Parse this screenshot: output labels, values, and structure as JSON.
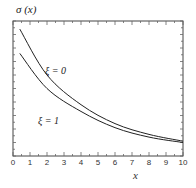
{
  "chart_data": {
    "type": "line",
    "title": "",
    "ylabel": "σ (x)",
    "xlabel": "x",
    "xlim": [
      0,
      10
    ],
    "ylim": [
      0,
      1
    ],
    "x_ticks": [
      "0",
      "1",
      "2",
      "3",
      "4",
      "5",
      "6",
      "7",
      "8",
      "9",
      "10"
    ],
    "y_ticks_labeled": false,
    "grid": false,
    "x": [
      0.4,
      2,
      4,
      6,
      8,
      10
    ],
    "series": [
      {
        "name": "ξ = 0",
        "values": [
          0.94,
          0.6,
          0.38,
          0.24,
          0.16,
          0.11
        ]
      },
      {
        "name": "ξ = 1",
        "values": [
          0.76,
          0.5,
          0.33,
          0.21,
          0.14,
          0.1
        ]
      }
    ],
    "annotations": [
      {
        "text": "ξ = 0",
        "x": 3.1,
        "y": 0.55
      },
      {
        "text": "ξ = 1",
        "x": 2.6,
        "y": 0.27
      }
    ]
  }
}
